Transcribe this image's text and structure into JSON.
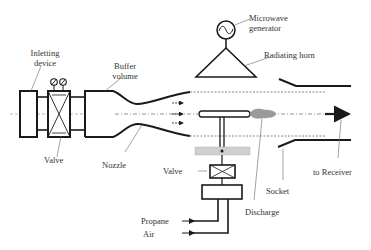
{
  "diagram": {
    "labels": {
      "inletting_device_line1": "Inletting",
      "inletting_device_line2": "device",
      "buffer_volume_line1": "Buffer",
      "buffer_volume_line2": "volume",
      "microwave_generator_line1": "Microwave",
      "microwave_generator_line2": "generator",
      "radiating_horn": "Radiating horn",
      "valve_left": "Valve",
      "nozzle": "Nozzle",
      "valve_bottom": "Valve",
      "discharge": "Discharge",
      "socket": "Socket",
      "to_receiver": "to Receiver",
      "propane": "Propane",
      "air": "Air"
    },
    "components": [
      {
        "id": "inletting-device",
        "label": "Inletting device"
      },
      {
        "id": "valve-inlet",
        "label": "Valve"
      },
      {
        "id": "buffer-volume",
        "label": "Buffer volume"
      },
      {
        "id": "nozzle",
        "label": "Nozzle"
      },
      {
        "id": "microwave-generator",
        "label": "Microwave generator"
      },
      {
        "id": "radiating-horn",
        "label": "Radiating horn"
      },
      {
        "id": "discharge",
        "label": "Discharge"
      },
      {
        "id": "socket",
        "label": "Socket"
      },
      {
        "id": "valve-fuel",
        "label": "Valve"
      },
      {
        "id": "receiver",
        "label": "to Receiver"
      }
    ],
    "inputs": [
      "Propane",
      "Air"
    ],
    "colors": {
      "line": "#1a1a1a",
      "leader": "#666666",
      "discharge_fill": "#9a9a9a",
      "gray_bar": "#cfcfcf",
      "dashed": "#777777"
    }
  }
}
